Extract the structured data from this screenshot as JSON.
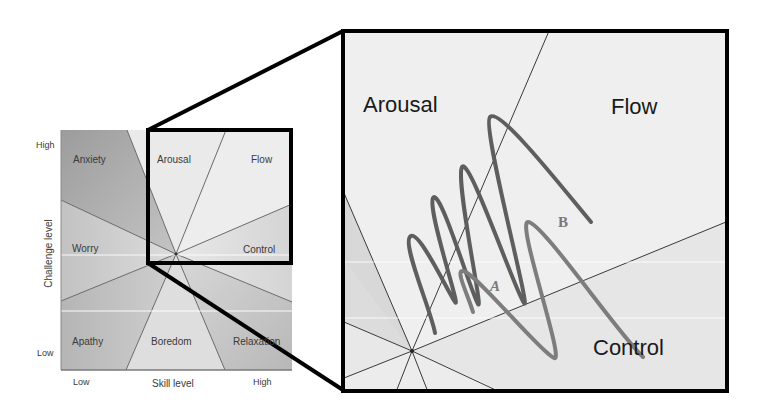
{
  "small_chart": {
    "y_axis_label": "Challenge level",
    "x_axis_label": "Skill level",
    "y_ticks": {
      "high": "High",
      "low": "Low"
    },
    "x_ticks": {
      "low": "Low",
      "high": "High"
    },
    "regions": {
      "anxiety": "Anxiety",
      "arousal": "Arousal",
      "flow": "Flow",
      "worry": "Worry",
      "control": "Control",
      "apathy": "Apathy",
      "boredom": "Boredom",
      "relaxation": "Relaxation"
    }
  },
  "zoom_panel": {
    "regions": {
      "arousal": "Arousal",
      "flow": "Flow",
      "control": "Control"
    },
    "curves": [
      {
        "name": "A",
        "label": "A",
        "color": "#7d7d7d"
      },
      {
        "name": "B",
        "label": "B",
        "color": "#5e5e5e"
      }
    ]
  },
  "colors": {
    "frame": "#000000",
    "region_dark": "#a9a9a9",
    "region_mid": "#c8c8c8",
    "region_light": "#e6e6e6",
    "divider": "#555555"
  }
}
